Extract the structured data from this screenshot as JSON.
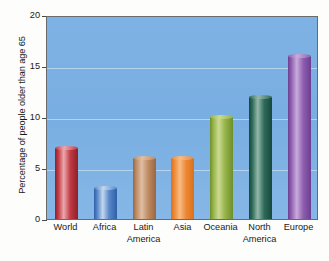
{
  "chart_data": {
    "type": "bar",
    "title": "",
    "subtitle": "",
    "xlabel": "",
    "ylabel": "Percentage of people older than age 65",
    "categories": [
      "World",
      "Africa",
      "Latin America",
      "Asia",
      "Oceania",
      "North America",
      "Europe"
    ],
    "category_lines": [
      [
        "World"
      ],
      [
        "Africa"
      ],
      [
        "Latin",
        "America"
      ],
      [
        "Asia"
      ],
      [
        "Oceania"
      ],
      [
        "North",
        "America"
      ],
      [
        "Europe"
      ]
    ],
    "values": [
      7,
      3,
      6,
      6,
      10,
      12,
      16
    ],
    "ylim": [
      0,
      20
    ],
    "yticks": [
      0,
      5,
      10,
      15,
      20
    ],
    "ytick_labels": [
      "0",
      "5",
      "10",
      "15",
      "20"
    ],
    "grid": true,
    "gridlines_at": [
      5,
      10,
      15
    ],
    "legend": "none",
    "legend_position": "none",
    "bar_style": "3d-cylinder",
    "bar_colors": [
      {
        "name": "World",
        "dark": "#8E2029",
        "mid": "#C03A42",
        "light": "#EAA9AE"
      },
      {
        "name": "Africa",
        "dark": "#2F5FA6",
        "mid": "#5787C9",
        "light": "#C2D7EE"
      },
      {
        "name": "Latin America",
        "dark": "#9A6642",
        "mid": "#BE8B63",
        "light": "#E0BFA4"
      },
      {
        "name": "Asia",
        "dark": "#D9701F",
        "mid": "#EE8734",
        "light": "#F7BC86"
      },
      {
        "name": "Oceania",
        "dark": "#6E8F2E",
        "mid": "#95B347",
        "light": "#CBDB93"
      },
      {
        "name": "North America",
        "dark": "#17483D",
        "mid": "#2E6A58",
        "light": "#94B8AB"
      },
      {
        "name": "Europe",
        "dark": "#6C3E92",
        "mid": "#8E5FAE",
        "light": "#C9ABDC"
      }
    ],
    "plot_background": "#7FB2E4",
    "gridline_color": "#BFD9F0",
    "axis_color": "#4a4a4a",
    "text_color": "#1a1a1a"
  }
}
